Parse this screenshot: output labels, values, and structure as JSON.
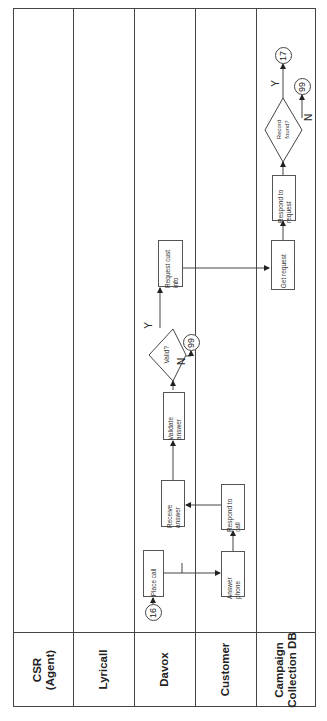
{
  "lanes": [
    {
      "label": "CSR\n(Agent)"
    },
    {
      "label": "Lyricall"
    },
    {
      "label": "Davox"
    },
    {
      "label": "Customer"
    },
    {
      "label": "Campaign\nCollection DB"
    }
  ],
  "nodes": {
    "connector_in": "16",
    "place_call": "Place call",
    "receive_answer": "Receive\nanswer",
    "validate_answer": "Validate\nanswer",
    "valid_decision": "Valid?",
    "valid_no_connector": "99",
    "request_cust_info": "Request cust\ninfo",
    "answer_phone": "Answer\nphone",
    "respond_to_call": "Respond to\ncall",
    "get_request": "Get request",
    "respond_to_request": "Respond to\nrequest",
    "record_found_decision": "Record\nfound?",
    "record_yes_connector": "17",
    "record_no_connector": "99"
  },
  "labels": {
    "yes": "Y",
    "no": "N"
  },
  "colors": {
    "line": "#444444",
    "background": "#ffffff",
    "text": "#222222"
  }
}
